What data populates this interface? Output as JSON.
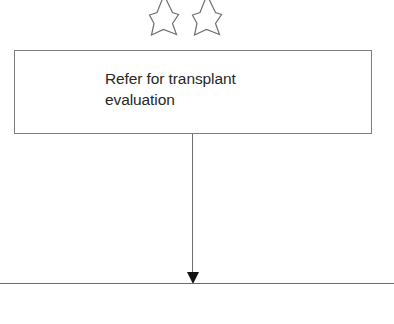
{
  "figure": {
    "type": "flowchart-fragment",
    "background_color": "#ffffff",
    "width": 394,
    "height": 324
  },
  "annotations": {
    "stars": [
      {
        "name": "star-marker-1",
        "fill": "none",
        "stroke": "#6f6f6f",
        "points": 5,
        "clipped_top": true
      },
      {
        "name": "star-marker-2",
        "fill": "none",
        "stroke": "#6f6f6f",
        "points": 5,
        "clipped_top": true
      }
    ]
  },
  "process_box": {
    "label": "Refer for transplant\nevaluation",
    "border_color": "#7d7d7d",
    "fill_color": "#ffffff",
    "text_color": "#282828"
  },
  "connector": {
    "name": "downward-arrow",
    "orientation": "vertical",
    "color": "#6e6e6e",
    "arrowhead_color": "#131313",
    "arrowhead_style": "solid-filled-triangle"
  },
  "baseline": {
    "name": "horizontal-rule",
    "color": "#6b6b6b"
  },
  "clipped_footer": {
    "text": "",
    "color": "#b9b9b9"
  }
}
